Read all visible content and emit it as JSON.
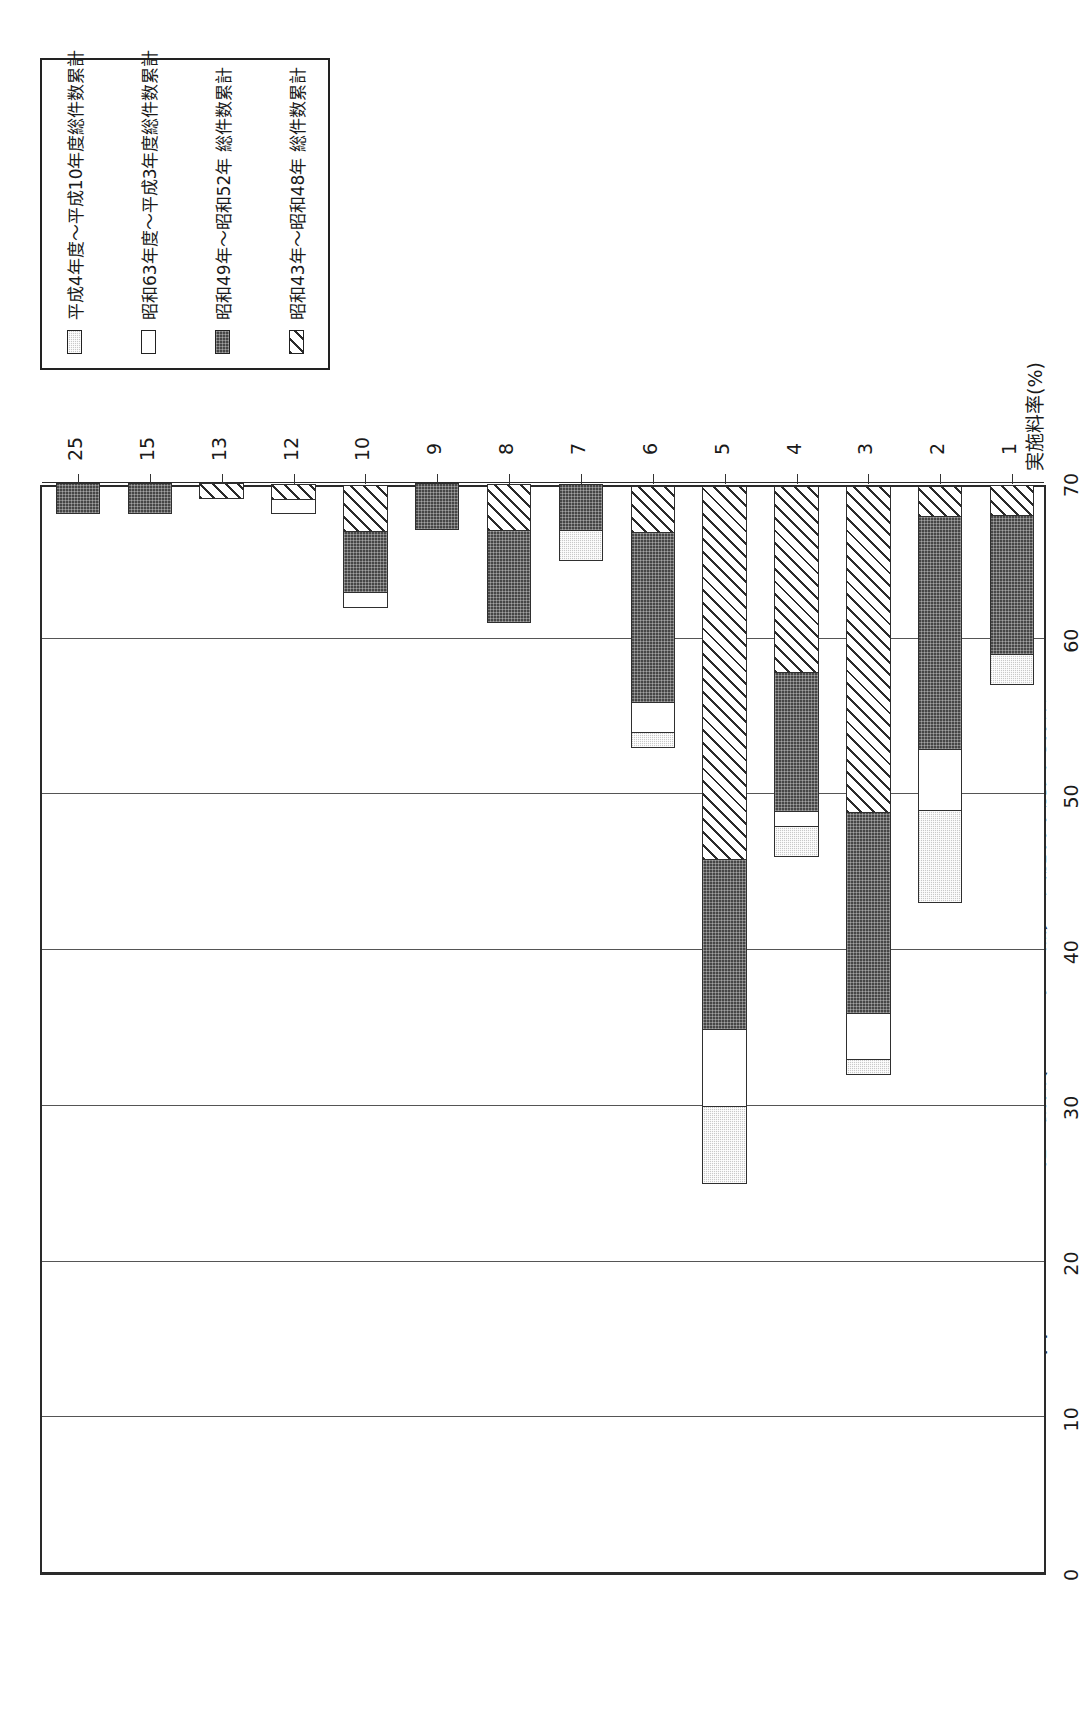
{
  "figure": {
    "number": "図 2 －16－ 2",
    "caption": "その他の機械(イニシャル 無)の実施料率別契約件数"
  },
  "legend": {
    "items": [
      {
        "label": "平成4年度～平成10年度総件数累計",
        "swatch": "light-gray-speckled",
        "color": "#c9c9c9",
        "key": "heisei4"
      },
      {
        "label": "昭和63年度～平成3年度総件数累計",
        "swatch": "white-empty",
        "color": "#ffffff",
        "key": "showa63"
      },
      {
        "label": "昭和49年～昭和52年 総件数累計",
        "swatch": "dark-dense",
        "color": "#464646",
        "key": "showa49"
      },
      {
        "label": "昭和43年～昭和48年 総件数累計",
        "swatch": "diagonal-hatch",
        "color": "#2b2b2b",
        "key": "showa43"
      }
    ]
  },
  "axes": {
    "value_axis_title": "件数",
    "value_ticks": [
      "0",
      "10",
      "20",
      "30",
      "40",
      "50",
      "60",
      "70"
    ],
    "category_axis_title": "実施料率(%)",
    "category_ticks": [
      "1",
      "2",
      "3",
      "4",
      "5",
      "6",
      "7",
      "8",
      "9",
      "10",
      "12",
      "13",
      "15",
      "25"
    ]
  },
  "chart_data": {
    "type": "bar",
    "title": "その他の機械(イニシャル 無)の実施料率別契約件数",
    "xlabel": "実施料率(%)",
    "ylabel": "件数",
    "ylim": [
      0,
      70
    ],
    "grid": true,
    "orientation": "vertical-stacked",
    "legend_position": "top-right",
    "categories": [
      "1",
      "2",
      "3",
      "4",
      "5",
      "6",
      "7",
      "8",
      "9",
      "10",
      "12",
      "13",
      "15",
      "25"
    ],
    "series": [
      {
        "name": "昭和43年～昭和48年 総件数累計",
        "style": "diagonal-hatch",
        "values": [
          2,
          2,
          21,
          12,
          24,
          3,
          0,
          3,
          0,
          3,
          1,
          1,
          0,
          0
        ]
      },
      {
        "name": "昭和49年～昭和52年 総件数累計",
        "style": "dark-dense",
        "values": [
          9,
          15,
          13,
          9,
          11,
          11,
          3,
          6,
          3,
          4,
          0,
          0,
          2,
          2
        ]
      },
      {
        "name": "昭和63年度～平成3年度総件数累計",
        "style": "white-empty",
        "values": [
          0,
          4,
          3,
          1,
          5,
          2,
          0,
          0,
          0,
          1,
          1,
          0,
          0,
          0
        ]
      },
      {
        "name": "平成4年度～平成10年度総件数累計",
        "style": "light-gray-speckled",
        "values": [
          2,
          6,
          1,
          2,
          5,
          1,
          2,
          0,
          0,
          0,
          0,
          0,
          0,
          0
        ]
      }
    ],
    "totals": [
      13,
      27,
      38,
      24,
      45,
      17,
      5,
      9,
      3,
      8,
      2,
      1,
      2,
      2
    ]
  }
}
